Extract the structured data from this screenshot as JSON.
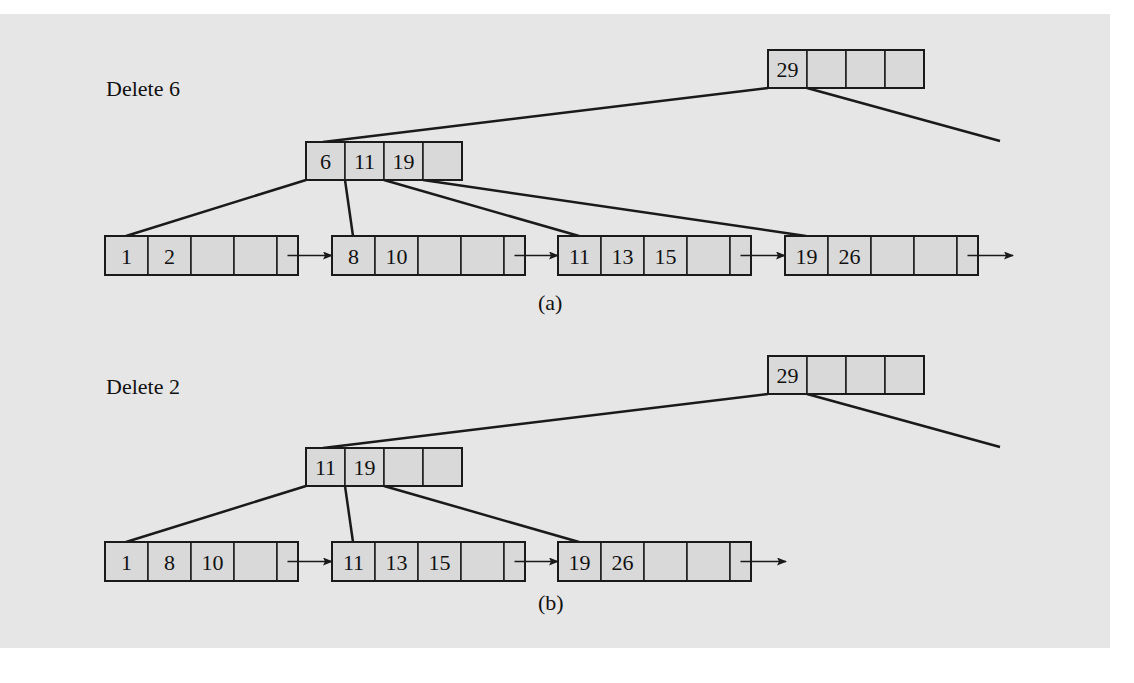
{
  "figure": {
    "colors": {
      "background": "#e6e6e6",
      "node_fill": "#d9d9d9",
      "stroke": "#1a1a1a"
    },
    "parts": [
      {
        "id": "a",
        "title": "Delete 6",
        "caption": "(a)",
        "root": {
          "keys": [
            "29",
            "",
            "",
            ""
          ]
        },
        "internal": {
          "keys": [
            "6",
            "11",
            "19",
            ""
          ]
        },
        "leaves": [
          {
            "keys": [
              "1",
              "2",
              "",
              ""
            ]
          },
          {
            "keys": [
              "8",
              "10",
              "",
              ""
            ]
          },
          {
            "keys": [
              "11",
              "13",
              "15",
              ""
            ]
          },
          {
            "keys": [
              "19",
              "26",
              "",
              ""
            ]
          }
        ]
      },
      {
        "id": "b",
        "title": "Delete 2",
        "caption": "(b)",
        "root": {
          "keys": [
            "29",
            "",
            "",
            ""
          ]
        },
        "internal": {
          "keys": [
            "11",
            "19",
            "",
            ""
          ]
        },
        "leaves": [
          {
            "keys": [
              "1",
              "8",
              "10",
              ""
            ]
          },
          {
            "keys": [
              "11",
              "13",
              "15",
              ""
            ]
          },
          {
            "keys": [
              "19",
              "26",
              "",
              ""
            ]
          }
        ]
      }
    ]
  }
}
